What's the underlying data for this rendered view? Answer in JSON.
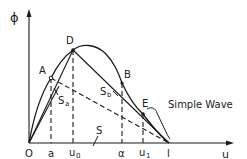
{
  "diagram": {
    "axes": {
      "y_label": "ϕ",
      "x_label": "u",
      "origin_label": "O"
    },
    "points": {
      "A": "A",
      "B": "B",
      "D": "D",
      "E": "E"
    },
    "x_ticks": [
      "a",
      "u₀",
      "α",
      "u",
      "1",
      "l"
    ],
    "tick_labels": {
      "a": "a",
      "u0_main": "u",
      "u0_sub": "0",
      "alpha": "α",
      "u1_main": "u",
      "u1_sub": "1",
      "l": "l"
    },
    "line_labels": {
      "Sa_main": "S",
      "Sa_sub": "a",
      "Sb_main": "S",
      "Sb_sub": "b",
      "S": "S"
    },
    "annotation": "Simple Wave",
    "colors": {
      "ink": "#1a1a1a",
      "background": "#ffffff"
    }
  }
}
